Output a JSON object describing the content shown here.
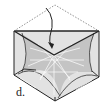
{
  "diagram": {
    "step_label": "d.",
    "colors": {
      "outline": "#222222",
      "fold_line": "#666666",
      "paper_light": "#e4e4e4",
      "paper_mid": "#c8c8c8",
      "pattern": "#ffffff"
    },
    "elements": [
      {
        "type": "valley-fold-line",
        "description": "dashed top flap outline"
      },
      {
        "type": "fold-arrow",
        "description": "curved arrow folding top flap down"
      },
      {
        "type": "hexagon-paper",
        "description": "crease pattern with white radial lines"
      }
    ]
  }
}
